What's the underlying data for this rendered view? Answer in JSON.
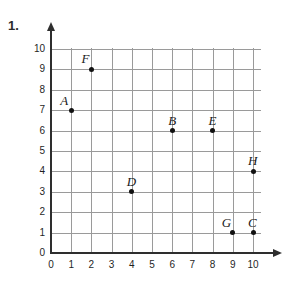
{
  "problem": {
    "number": "1."
  },
  "chart_data": {
    "type": "scatter",
    "title": "",
    "xlabel": "",
    "ylabel": "",
    "xlim": [
      0,
      10
    ],
    "ylim": [
      0,
      10
    ],
    "grid": true,
    "legend": "none",
    "x_ticks": [
      "0",
      "1",
      "2",
      "3",
      "4",
      "5",
      "6",
      "7",
      "8",
      "9",
      "10"
    ],
    "y_ticks": [
      "0",
      "1",
      "2",
      "3",
      "4",
      "5",
      "6",
      "7",
      "8",
      "9",
      "10"
    ],
    "points": [
      {
        "label": "A",
        "x": 1,
        "y": 7,
        "label_dx": -11,
        "label_dy": -17
      },
      {
        "label": "B",
        "x": 6,
        "y": 6,
        "label_dx": -4,
        "label_dy": -18
      },
      {
        "label": "C",
        "x": 10,
        "y": 1,
        "label_dx": -5,
        "label_dy": -18
      },
      {
        "label": "D",
        "x": 4,
        "y": 3,
        "label_dx": -5,
        "label_dy": -18
      },
      {
        "label": "E",
        "x": 8,
        "y": 6,
        "label_dx": -4,
        "label_dy": -18
      },
      {
        "label": "F",
        "x": 2,
        "y": 9,
        "label_dx": -10,
        "label_dy": -18
      },
      {
        "label": "G",
        "x": 9,
        "y": 1,
        "label_dx": -11,
        "label_dy": -18
      },
      {
        "label": "H",
        "x": 10,
        "y": 4,
        "label_dx": -5,
        "label_dy": -18
      }
    ]
  },
  "axes": {
    "x_arrow_icon": "arrow-right-icon",
    "y_arrow_icon": "arrow-up-icon"
  }
}
